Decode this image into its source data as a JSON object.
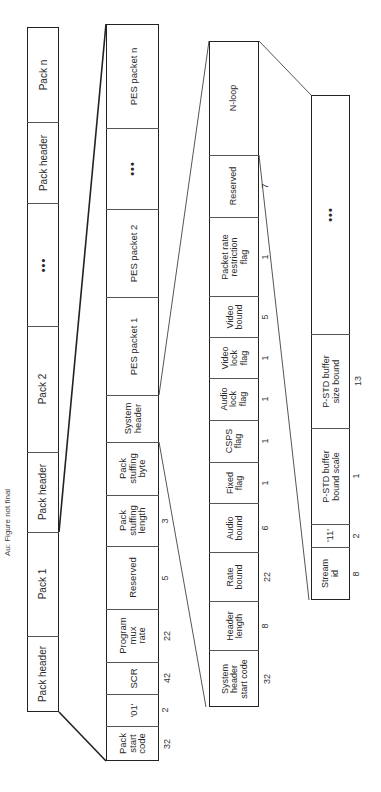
{
  "note": "Au: Figure not final",
  "levels": [
    {
      "name": "program-stream",
      "x": 27,
      "w": 32,
      "top": 27,
      "bottom": 712,
      "fontSize": 10,
      "cells": [
        {
          "label": "Pack n",
          "y0": 27,
          "y1": 122
        },
        {
          "label": "Pack header",
          "y0": 122,
          "y1": 203
        },
        {
          "label": "•••",
          "y0": 203,
          "y1": 326,
          "dots": true
        },
        {
          "label": "Pack 2",
          "y0": 326,
          "y1": 452
        },
        {
          "label": "Pack header",
          "y0": 452,
          "y1": 532
        },
        {
          "label": "Pack 1",
          "y0": 532,
          "y1": 636
        },
        {
          "label": "Pack header",
          "y0": 636,
          "y1": 712
        }
      ]
    },
    {
      "name": "pack",
      "x": 106,
      "w": 53,
      "top": 24,
      "bottom": 761,
      "fontSize": 9.5,
      "cells": [
        {
          "label": "PES packet n",
          "y0": 24,
          "y1": 128
        },
        {
          "label": "•••",
          "y0": 128,
          "y1": 209,
          "dots": true
        },
        {
          "label": "PES packet 2",
          "y0": 209,
          "y1": 297
        },
        {
          "label": "PES packet 1",
          "y0": 297,
          "y1": 395
        },
        {
          "label": "System\nheader",
          "y0": 395,
          "y1": 442
        },
        {
          "label": "Pack\nstuffing\nbyte",
          "y0": 442,
          "y1": 495
        },
        {
          "label": "Pack\nstuffing\nlength",
          "y0": 495,
          "y1": 546,
          "bits": "3"
        },
        {
          "label": "Reserved",
          "y0": 546,
          "y1": 609,
          "bits": "5"
        },
        {
          "label": "Program\nmux\nrate",
          "y0": 609,
          "y1": 662,
          "bits": "22"
        },
        {
          "label": "SCR",
          "y0": 662,
          "y1": 694,
          "bits": "42"
        },
        {
          "label": "'01'",
          "y0": 694,
          "y1": 726,
          "bits": "2"
        },
        {
          "label": "Pack\nstart\ncode",
          "y0": 726,
          "y1": 761,
          "bits": "32"
        }
      ]
    },
    {
      "name": "system-header",
      "x": 209,
      "w": 50,
      "top": 41,
      "bottom": 707,
      "fontSize": 9,
      "cells": [
        {
          "label": "N-loop",
          "y0": 41,
          "y1": 155
        },
        {
          "label": "Reserved",
          "y0": 155,
          "y1": 217,
          "bits": "7"
        },
        {
          "label": "Packet rate\nrestriction\nflag",
          "y0": 217,
          "y1": 296,
          "bits": "1"
        },
        {
          "label": "Video\nbound",
          "y0": 296,
          "y1": 337,
          "bits": "5"
        },
        {
          "label": "Video\nlock\nflag",
          "y0": 337,
          "y1": 378,
          "bits": "1"
        },
        {
          "label": "Audio\nlock\nflag",
          "y0": 378,
          "y1": 420,
          "bits": "1"
        },
        {
          "label": "CSPS\nflag",
          "y0": 420,
          "y1": 462,
          "bits": "1"
        },
        {
          "label": "Fixed\nflag",
          "y0": 462,
          "y1": 503,
          "bits": "1"
        },
        {
          "label": "Audio\nbound",
          "y0": 503,
          "y1": 552,
          "bits": "6"
        },
        {
          "label": "Rate\nbound",
          "y0": 552,
          "y1": 601,
          "bits": "22"
        },
        {
          "label": "Header\nlength",
          "y0": 601,
          "y1": 650,
          "bits": "8"
        },
        {
          "label": "System\nheader\nstart code",
          "y0": 650,
          "y1": 707,
          "bits": "32"
        }
      ]
    },
    {
      "name": "n-loop",
      "x": 311,
      "w": 39,
      "top": 95,
      "bottom": 600,
      "fontSize": 9,
      "cells": [
        {
          "label": "•••",
          "y0": 95,
          "y1": 334,
          "dots": true
        },
        {
          "label": "P-STD buffer\nsize bound",
          "y0": 334,
          "y1": 428,
          "bits": "13"
        },
        {
          "label": "P-STD buffer\nbound scale",
          "y0": 428,
          "y1": 524,
          "bits": "1"
        },
        {
          "label": "'11'",
          "y0": 524,
          "y1": 547,
          "bits": "2"
        },
        {
          "label": "Stream\nid",
          "y0": 547,
          "y1": 600,
          "bits": "8"
        }
      ]
    }
  ],
  "connectors": [
    {
      "x1": 59,
      "y1": 532,
      "x2": 106,
      "y2": 24,
      "w": 1.6
    },
    {
      "x1": 59,
      "y1": 712,
      "x2": 106,
      "y2": 761,
      "w": 1.6
    },
    {
      "x1": 159,
      "y1": 395,
      "x2": 209,
      "y2": 41,
      "w": 1
    },
    {
      "x1": 159,
      "y1": 442,
      "x2": 206,
      "y2": 707,
      "w": 1
    },
    {
      "x1": 259,
      "y1": 41,
      "x2": 311,
      "y2": 95,
      "w": 1
    },
    {
      "x1": 259,
      "y1": 155,
      "x2": 309,
      "y2": 600,
      "w": 1
    }
  ],
  "colors": {
    "line": "#222222",
    "thin": "#555555",
    "text": "#2a2a2a"
  }
}
